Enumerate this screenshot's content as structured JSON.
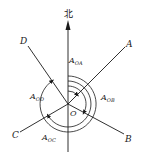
{
  "diagram": {
    "north_label": "北",
    "center_label": "O",
    "colors": {
      "stroke": "#1a1a1a",
      "background": "#ffffff"
    },
    "directions": [
      {
        "id": "A",
        "label": "A",
        "angle_label_main": "A",
        "angle_label_sub": "OA"
      },
      {
        "id": "B",
        "label": "B",
        "angle_label_main": "A",
        "angle_label_sub": "OB"
      },
      {
        "id": "C",
        "label": "C",
        "angle_label_main": "A",
        "angle_label_sub": "OC"
      },
      {
        "id": "D",
        "label": "D",
        "angle_label_main": "A",
        "angle_label_sub": "OD"
      }
    ]
  }
}
